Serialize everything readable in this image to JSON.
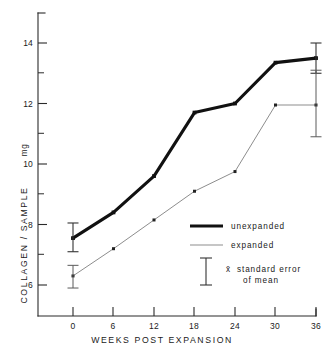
{
  "chart_data": {
    "type": "line",
    "title": "",
    "xlabel": "WEEKS POST EXPANSION",
    "ylabel": "COLLAGEN / SAMPLE",
    "yunit": "mg",
    "x": [
      0,
      6,
      12,
      18,
      24,
      30,
      36
    ],
    "categories": [
      "0",
      "6",
      "12",
      "18",
      "24",
      "30",
      "36"
    ],
    "xtick_labels": [
      "0",
      "6",
      "12",
      "18",
      "24",
      "30",
      "36"
    ],
    "ytick_labels": [
      "6",
      "8",
      "10",
      "12",
      "14"
    ],
    "ytick_values": [
      6,
      8,
      10,
      12,
      14
    ],
    "yminor_values": [
      7,
      9,
      11,
      13
    ],
    "xlim": [
      -3,
      38
    ],
    "ylim": [
      5.2,
      14.85
    ],
    "grid": false,
    "legend_position": "center-right",
    "series": [
      {
        "name": "unexpanded",
        "style": "thick",
        "color": "#111111",
        "values": [
          7.55,
          8.4,
          9.6,
          11.7,
          12.0,
          13.35,
          13.5
        ]
      },
      {
        "name": "expanded",
        "style": "thin",
        "color": "#8d8d8d",
        "values": [
          6.3,
          7.2,
          8.15,
          9.1,
          9.75,
          11.95,
          11.95
        ]
      }
    ],
    "error_bars": [
      {
        "series": "unexpanded",
        "x": 0,
        "y": 7.55,
        "low": 7.1,
        "high": 8.05
      },
      {
        "series": "expanded",
        "x": 0,
        "y": 6.3,
        "low": 5.9,
        "high": 6.65
      },
      {
        "series": "unexpanded",
        "x": 36,
        "y": 13.5,
        "low": 13.0,
        "high": 14.0
      },
      {
        "series": "expanded",
        "x": 36,
        "y": 11.95,
        "low": 10.9,
        "high": 13.1
      }
    ]
  },
  "legend": {
    "entries": [
      {
        "label": "unexpanded",
        "marker": "thick-line"
      },
      {
        "label": "expanded",
        "marker": "thin-line"
      },
      {
        "label": "standard error",
        "label2": "of mean",
        "symbol": "x̄",
        "marker": "error-bar"
      }
    ]
  },
  "axes": {
    "y_title": "COLLAGEN / SAMPLE",
    "y_unit": "mg",
    "x_title": "WEEKS POST EXPANSION"
  }
}
